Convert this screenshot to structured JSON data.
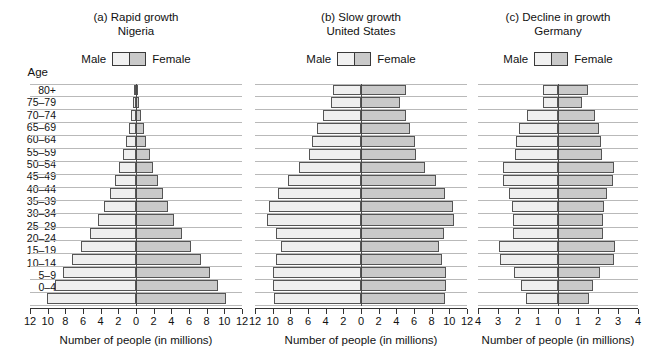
{
  "figure": {
    "age_axis_label": "Age",
    "legend": {
      "male_label": "Male",
      "female_label": "Female",
      "male_color": "#efefef",
      "female_color": "#c9c9c9",
      "border_color": "#555555"
    },
    "age_groups": [
      "80+",
      "75–79",
      "70–74",
      "65–69",
      "60–64",
      "55–59",
      "50–54",
      "45–49",
      "40–44",
      "35–39",
      "30–34",
      "25–29",
      "20–24",
      "15–19",
      "10–14",
      "5–9",
      "0–4"
    ]
  },
  "chart_data": [
    {
      "type": "bar",
      "id": "nigeria",
      "title": "(a) Rapid growth",
      "subtitle": "Nigeria",
      "xlabel": "Number of people (in millions)",
      "ylabel": "Age",
      "xlim": [
        -12,
        12
      ],
      "xticks": [
        12,
        10,
        8,
        6,
        4,
        2,
        0,
        2,
        4,
        6,
        8,
        10,
        12
      ],
      "xtick_values": [
        -12,
        -10,
        -8,
        -6,
        -4,
        -2,
        0,
        2,
        4,
        6,
        8,
        10,
        12
      ],
      "grid": true,
      "legend_position": "top-center",
      "categories": [
        "80+",
        "75–79",
        "70–74",
        "65–69",
        "60–64",
        "55–59",
        "50–54",
        "45–49",
        "40–44",
        "35–39",
        "30–34",
        "25–29",
        "20–24",
        "15–19",
        "10–14",
        "5–9",
        "0–4"
      ],
      "series": [
        {
          "name": "Male",
          "values": [
            0.15,
            0.35,
            0.55,
            0.8,
            1.1,
            1.5,
            1.9,
            2.4,
            3.0,
            3.6,
            4.3,
            5.2,
            6.2,
            7.3,
            8.3,
            9.2,
            10.1
          ]
        },
        {
          "name": "Female",
          "values": [
            0.18,
            0.38,
            0.58,
            0.85,
            1.15,
            1.55,
            1.95,
            2.45,
            3.05,
            3.65,
            4.35,
            5.25,
            6.25,
            7.35,
            8.35,
            9.25,
            10.15
          ]
        }
      ]
    },
    {
      "type": "bar",
      "id": "united-states",
      "title": "(b) Slow growth",
      "subtitle": "United States",
      "xlabel": "Number of people (in millions)",
      "ylabel": "Age",
      "xlim": [
        -12,
        12
      ],
      "xticks": [
        12,
        10,
        8,
        6,
        4,
        2,
        0,
        2,
        4,
        6,
        8,
        10,
        12
      ],
      "xtick_values": [
        -12,
        -10,
        -8,
        -6,
        -4,
        -2,
        0,
        2,
        4,
        6,
        8,
        10,
        12
      ],
      "grid": true,
      "legend_position": "top-center",
      "categories": [
        "80+",
        "75–79",
        "70–74",
        "65–69",
        "60–64",
        "55–59",
        "50–54",
        "45–49",
        "40–44",
        "35–39",
        "30–34",
        "25–29",
        "20–24",
        "15–19",
        "10–14",
        "5–9",
        "0–4"
      ],
      "series": [
        {
          "name": "Male",
          "values": [
            3.2,
            3.4,
            4.3,
            5.0,
            5.6,
            5.9,
            7.0,
            8.3,
            9.4,
            10.4,
            10.6,
            9.6,
            9.1,
            9.6,
            10.0,
            10.0,
            9.9
          ]
        },
        {
          "name": "Female",
          "values": [
            5.1,
            4.4,
            5.1,
            5.6,
            6.1,
            6.2,
            7.2,
            8.5,
            9.5,
            10.4,
            10.5,
            9.4,
            8.8,
            9.2,
            9.6,
            9.6,
            9.5
          ]
        }
      ]
    },
    {
      "type": "bar",
      "id": "germany",
      "title": "(c) Decline in growth",
      "subtitle": "Germany",
      "xlabel": "Number of people (in millions)",
      "ylabel": "Age",
      "xlim": [
        -4,
        4
      ],
      "xticks": [
        4,
        3,
        2,
        1,
        0,
        1,
        2,
        3,
        4
      ],
      "xtick_values": [
        -4,
        -3,
        -2,
        -1,
        0,
        1,
        2,
        3,
        4
      ],
      "grid": true,
      "legend_position": "top-center",
      "categories": [
        "80+",
        "75–79",
        "70–74",
        "65–69",
        "60–64",
        "55–59",
        "50–54",
        "45–49",
        "40–44",
        "35–39",
        "30–34",
        "25–29",
        "20–24",
        "15–19",
        "10–14",
        "5–9",
        "0–4"
      ],
      "series": [
        {
          "name": "Male",
          "values": [
            0.75,
            0.75,
            1.55,
            1.95,
            2.1,
            2.15,
            2.75,
            2.75,
            2.45,
            2.3,
            2.25,
            2.25,
            2.95,
            2.9,
            2.2,
            1.85,
            1.6
          ]
        },
        {
          "name": "Female",
          "values": [
            1.5,
            1.2,
            1.85,
            2.05,
            2.15,
            2.2,
            2.8,
            2.75,
            2.45,
            2.3,
            2.25,
            2.25,
            2.85,
            2.8,
            2.1,
            1.75,
            1.55
          ]
        }
      ]
    }
  ]
}
